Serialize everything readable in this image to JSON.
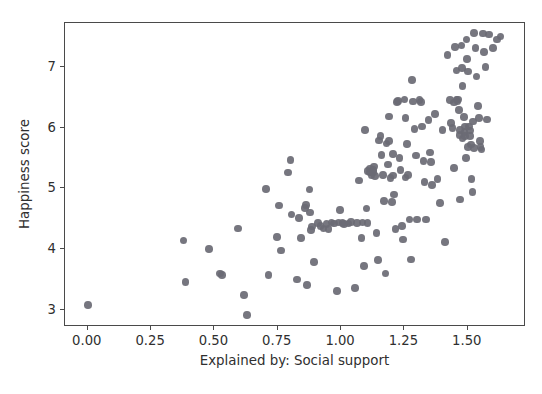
{
  "chart_data": {
    "type": "scatter",
    "title": "",
    "xlabel": "Explained by: Social support",
    "ylabel": "Happiness score",
    "xlim": [
      -0.09,
      1.73
    ],
    "ylim": [
      2.72,
      7.72
    ],
    "xticks": [
      "0.00",
      "0.25",
      "0.50",
      "0.75",
      "1.00",
      "1.25",
      "1.50"
    ],
    "xtick_values": [
      0.0,
      0.25,
      0.5,
      0.75,
      1.0,
      1.25,
      1.5
    ],
    "yticks": [
      "3",
      "4",
      "5",
      "6",
      "7"
    ],
    "ytick_values": [
      3,
      4,
      5,
      6,
      7
    ],
    "grid": false,
    "legend": null,
    "marker": {
      "shape": "circle",
      "color": "#6a6a74",
      "size": 7.6,
      "opacity": 0.92
    },
    "series": [
      {
        "name": "countries",
        "points": [
          [
            0.0,
            3.08
          ],
          [
            0.378,
            4.14
          ],
          [
            0.385,
            3.46
          ],
          [
            0.478,
            4.0
          ],
          [
            0.523,
            3.6
          ],
          [
            0.53,
            3.58
          ],
          [
            0.592,
            4.34
          ],
          [
            0.617,
            3.25
          ],
          [
            0.628,
            2.92
          ],
          [
            0.703,
            4.99
          ],
          [
            0.713,
            3.58
          ],
          [
            0.747,
            4.2
          ],
          [
            0.756,
            4.72
          ],
          [
            0.762,
            3.98
          ],
          [
            0.79,
            5.26
          ],
          [
            0.8,
            5.47
          ],
          [
            0.804,
            4.57
          ],
          [
            0.826,
            3.5
          ],
          [
            0.833,
            4.51
          ],
          [
            0.842,
            4.18
          ],
          [
            0.857,
            4.68
          ],
          [
            0.862,
            4.73
          ],
          [
            0.866,
            3.41
          ],
          [
            0.875,
            4.98
          ],
          [
            0.878,
            4.6
          ],
          [
            0.882,
            4.32
          ],
          [
            0.886,
            4.37
          ],
          [
            0.893,
            3.79
          ],
          [
            0.91,
            4.43
          ],
          [
            0.918,
            4.38
          ],
          [
            0.93,
            4.34
          ],
          [
            0.943,
            4.41
          ],
          [
            0.95,
            4.33
          ],
          [
            0.962,
            4.44
          ],
          [
            0.973,
            4.42
          ],
          [
            0.985,
            3.31
          ],
          [
            0.99,
            4.44
          ],
          [
            0.995,
            4.64
          ],
          [
            1.005,
            4.43
          ],
          [
            1.012,
            4.41
          ],
          [
            1.03,
            4.42
          ],
          [
            1.04,
            4.45
          ],
          [
            1.055,
            3.36
          ],
          [
            1.062,
            4.43
          ],
          [
            1.07,
            5.13
          ],
          [
            1.08,
            4.18
          ],
          [
            1.085,
            4.44
          ],
          [
            1.09,
            3.72
          ],
          [
            1.095,
            5.96
          ],
          [
            1.1,
            4.67
          ],
          [
            1.105,
            4.43
          ],
          [
            1.115,
            5.26
          ],
          [
            1.12,
            5.21
          ],
          [
            1.125,
            5.3
          ],
          [
            1.13,
            5.36
          ],
          [
            1.135,
            5.2
          ],
          [
            1.14,
            4.27
          ],
          [
            1.145,
            3.82
          ],
          [
            1.15,
            5.79
          ],
          [
            1.155,
            5.86
          ],
          [
            1.16,
            5.55
          ],
          [
            1.165,
            5.22
          ],
          [
            1.17,
            4.79
          ],
          [
            1.175,
            3.6
          ],
          [
            1.18,
            5.74
          ],
          [
            1.185,
            5.39
          ],
          [
            1.19,
            6.18
          ],
          [
            1.195,
            5.17
          ],
          [
            1.2,
            4.78
          ],
          [
            1.205,
            5.21
          ],
          [
            1.21,
            4.9
          ],
          [
            1.215,
            4.33
          ],
          [
            1.22,
            6.42
          ],
          [
            1.225,
            6.44
          ],
          [
            1.23,
            5.5
          ],
          [
            1.235,
            5.3
          ],
          [
            1.24,
            4.38
          ],
          [
            1.245,
            4.16
          ],
          [
            1.25,
            6.46
          ],
          [
            1.255,
            6.16
          ],
          [
            1.26,
            5.73
          ],
          [
            1.265,
            5.22
          ],
          [
            1.27,
            4.49
          ],
          [
            1.275,
            3.83
          ],
          [
            1.28,
            6.78
          ],
          [
            1.285,
            6.43
          ],
          [
            1.29,
            5.98
          ],
          [
            1.295,
            5.54
          ],
          [
            1.3,
            4.49
          ],
          [
            1.31,
            6.45
          ],
          [
            1.315,
            6.42
          ],
          [
            1.32,
            6.02
          ],
          [
            1.325,
            5.45
          ],
          [
            1.33,
            5.1
          ],
          [
            1.335,
            4.49
          ],
          [
            1.345,
            6.12
          ],
          [
            1.35,
            5.59
          ],
          [
            1.355,
            5.43
          ],
          [
            1.36,
            5.06
          ],
          [
            1.37,
            6.22
          ],
          [
            1.38,
            5.15
          ],
          [
            1.39,
            4.76
          ],
          [
            1.4,
            5.96
          ],
          [
            1.41,
            4.12
          ],
          [
            1.42,
            7.19
          ],
          [
            1.43,
            6.45
          ],
          [
            1.435,
            6.08
          ],
          [
            1.44,
            5.99
          ],
          [
            1.445,
            5.34
          ],
          [
            1.45,
            7.33
          ],
          [
            1.455,
            6.94
          ],
          [
            1.46,
            6.43
          ],
          [
            1.462,
            6.46
          ],
          [
            1.465,
            6.29
          ],
          [
            1.468,
            5.88
          ],
          [
            1.47,
            4.82
          ],
          [
            1.475,
            7.35
          ],
          [
            1.478,
            6.98
          ],
          [
            1.48,
            6.68
          ],
          [
            1.485,
            6.17
          ],
          [
            1.488,
            5.93
          ],
          [
            1.49,
            5.86
          ],
          [
            1.492,
            5.5
          ],
          [
            1.495,
            7.45
          ],
          [
            1.498,
            7.13
          ],
          [
            1.5,
            6.92
          ],
          [
            1.505,
            6.02
          ],
          [
            1.508,
            5.95
          ],
          [
            1.51,
            5.86
          ],
          [
            1.512,
            5.72
          ],
          [
            1.515,
            5.15
          ],
          [
            1.518,
            4.94
          ],
          [
            1.525,
            7.56
          ],
          [
            1.53,
            7.31
          ],
          [
            1.535,
            6.84
          ],
          [
            1.54,
            6.35
          ],
          [
            1.545,
            6.16
          ],
          [
            1.548,
            5.78
          ],
          [
            1.55,
            5.68
          ],
          [
            1.555,
            5.64
          ],
          [
            1.56,
            7.55
          ],
          [
            1.565,
            7.24
          ],
          [
            1.57,
            7.0
          ],
          [
            1.575,
            6.13
          ],
          [
            1.585,
            7.53
          ],
          [
            1.6,
            7.31
          ],
          [
            1.615,
            7.45
          ],
          [
            1.63,
            7.5
          ],
          [
            1.105,
            5.29
          ],
          [
            1.115,
            5.33
          ],
          [
            1.128,
            5.27
          ],
          [
            1.255,
            5.18
          ],
          [
            1.19,
            5.78
          ],
          [
            1.205,
            5.57
          ],
          [
            1.445,
            6.41
          ],
          [
            1.455,
            6.46
          ],
          [
            1.47,
            5.96
          ],
          [
            1.48,
            5.82
          ],
          [
            1.49,
            6.02
          ],
          [
            1.5,
            5.68
          ],
          [
            1.52,
            6.1
          ],
          [
            1.525,
            5.66
          ]
        ]
      }
    ]
  },
  "axes": {
    "xlabel": "Explained by: Social support",
    "ylabel": "Happiness score"
  }
}
